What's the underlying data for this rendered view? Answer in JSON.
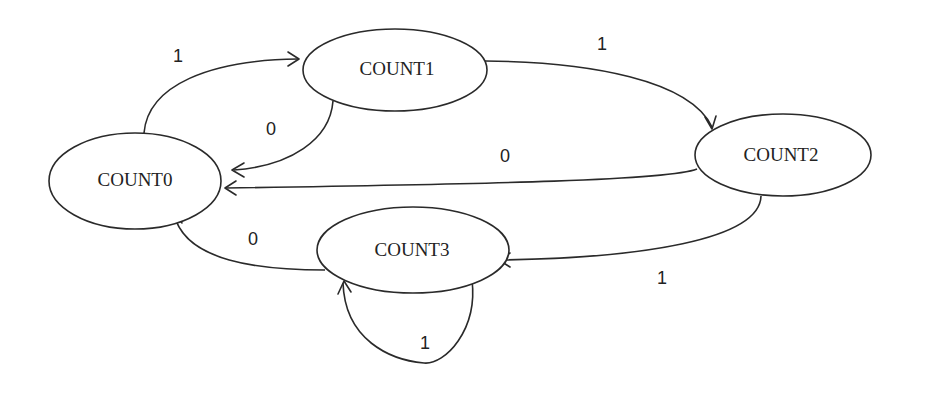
{
  "diagram": {
    "type": "state-machine",
    "states": [
      {
        "id": "COUNT0",
        "label": "COUNT0"
      },
      {
        "id": "COUNT1",
        "label": "COUNT1"
      },
      {
        "id": "COUNT2",
        "label": "COUNT2"
      },
      {
        "id": "COUNT3",
        "label": "COUNT3"
      }
    ],
    "transitions": [
      {
        "from": "COUNT0",
        "to": "COUNT1",
        "label": "1"
      },
      {
        "from": "COUNT1",
        "to": "COUNT0",
        "label": "0"
      },
      {
        "from": "COUNT1",
        "to": "COUNT2",
        "label": "1"
      },
      {
        "from": "COUNT2",
        "to": "COUNT0",
        "label": "0"
      },
      {
        "from": "COUNT2",
        "to": "COUNT3",
        "label": "1"
      },
      {
        "from": "COUNT3",
        "to": "COUNT0",
        "label": "0"
      },
      {
        "from": "COUNT3",
        "to": "COUNT3",
        "label": "1"
      }
    ]
  }
}
